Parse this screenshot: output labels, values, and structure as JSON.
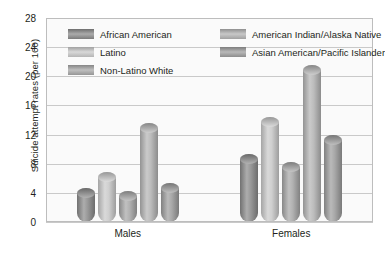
{
  "chart_data": {
    "type": "bar",
    "title": "",
    "xlabel": "",
    "ylabel": "Suicide attempt rates (per 100)",
    "categories": [
      "Males",
      "Females"
    ],
    "ylim": [
      0,
      28
    ],
    "ytick_step": 4,
    "yticks": [
      "0",
      "4",
      "8",
      "12",
      "16",
      "20",
      "24",
      "28"
    ],
    "grid": true,
    "legend_position": "top-inside",
    "series": [
      {
        "name": "African American",
        "values": [
          4.7,
          9.3
        ],
        "color": "#8a8a8a"
      },
      {
        "name": "Latino",
        "values": [
          6.8,
          14.4
        ],
        "color": "#c9c9c9"
      },
      {
        "name": "Non-Latino White",
        "values": [
          4.3,
          8.2
        ],
        "color": "#a6a6a6"
      },
      {
        "name": "American Indian/Alaska Native",
        "values": [
          13.6,
          21.5
        ],
        "color": "#b3b3b3"
      },
      {
        "name": "Asian American/Pacific Islander",
        "values": [
          5.4,
          12.0
        ],
        "color": "#9c9c9c"
      }
    ]
  },
  "legend": {
    "column_left": [
      "African American",
      "Latino",
      "Non-Latino White"
    ],
    "column_right": [
      "American Indian/Alaska Native",
      "Asian American/Pacific Islander"
    ]
  }
}
